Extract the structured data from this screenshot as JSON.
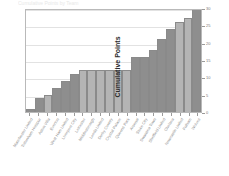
{
  "chart": {
    "title": "Cumulative Points by Team",
    "y_axis_title": "Cumulative Points",
    "axis_color": "#9a9a9a",
    "grid_color": "#e2e2e2",
    "bar_dark_color": "#8e8e8e",
    "bar_light_color": "#b4b4b4",
    "bar_outline_color": "#8a8a8a",
    "plot_background": "#ffffff"
  },
  "chart_data": {
    "type": "bar",
    "title": "Cumulative Points by Team",
    "xlabel": "",
    "ylabel": "Cumulative Points",
    "ylim": [
      0,
      30
    ],
    "yticks": [
      0,
      5,
      10,
      15,
      20,
      25,
      30
    ],
    "grid": true,
    "legend": "none",
    "categories": [
      "Manchester United",
      "Tottenham Hotspur",
      "Aston Villa",
      "Everton",
      "West Ham United",
      "Liverpool City",
      "Leicester",
      "Middlesbrough",
      "Leeds United",
      "Derby County",
      "Crystal Palace",
      "Queens Park",
      "Arsenal",
      "Stoke City",
      "Swansea Town",
      "Sheffield United",
      "Chelsea",
      "Newcastle United",
      "Fulham",
      "Wolves"
    ],
    "values": [
      1,
      4,
      5,
      7,
      9,
      11,
      12,
      12,
      12,
      12,
      12,
      12,
      16,
      16,
      18,
      21,
      24,
      26,
      27,
      30
    ],
    "bar_shades": [
      "dark",
      "dark",
      "light",
      "dark",
      "dark",
      "dark",
      "light",
      "light",
      "light",
      "light",
      "light",
      "light",
      "dark",
      "dark",
      "dark",
      "dark",
      "dark",
      "light",
      "light",
      "dark"
    ]
  }
}
